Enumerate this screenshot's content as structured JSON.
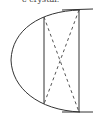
{
  "caption": "e crystal.",
  "diagram": {
    "stroke_color": "#333333",
    "elements": [
      "curved-left-edge",
      "top-line",
      "bottom-line",
      "vertical-line-left",
      "vertical-line-right",
      "dashed-diagonal-1",
      "dashed-diagonal-2"
    ]
  }
}
